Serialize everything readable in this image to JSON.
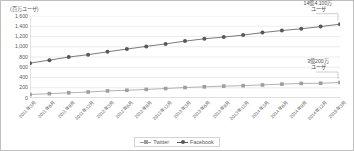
{
  "chart_data": {
    "type": "line",
    "title": "",
    "ylabel": "(百万ユーザ)",
    "xlabel": "",
    "ylim": [
      0,
      1600
    ],
    "ytick_step": 200,
    "grid": true,
    "legend_position": "bottom",
    "ytick_labels": [
      "0",
      "200",
      "400",
      "600",
      "800",
      "1,000",
      "1,200",
      "1,400",
      "1,600"
    ],
    "ytick_values": [
      0,
      200,
      400,
      600,
      800,
      1000,
      1200,
      1400,
      1600
    ],
    "categories": [
      "2011年3月",
      "2011年6月",
      "2011年9月",
      "2011年12月",
      "2012年3月",
      "2012年6月",
      "2012年9月",
      "2012年12月",
      "2013年3月",
      "2013年6月",
      "2013年9月",
      "2013年12月",
      "2014年3月",
      "2014年6月",
      "2014年9月",
      "2014年12月",
      "2015年3月"
    ],
    "series": [
      {
        "name": "Twitter",
        "color": "#9e9e9e",
        "marker": "square",
        "values": [
          68,
          85,
          101,
          117,
          138,
          151,
          167,
          185,
          204,
          218,
          232,
          241,
          255,
          271,
          284,
          288,
          302
        ]
      },
      {
        "name": "Facebook",
        "color": "#595959",
        "marker": "circle",
        "values": [
          680,
          739,
          800,
          845,
          901,
          955,
          1007,
          1056,
          1110,
          1155,
          1189,
          1228,
          1276,
          1317,
          1350,
          1393,
          1441
        ]
      }
    ],
    "annotations": [
      {
        "id": "facebook-callout",
        "text_line1": "14億4,100万",
        "text_line2": "ユーザ",
        "target_series": "Facebook",
        "target_point": "2015年3月",
        "target_value": 1441
      },
      {
        "id": "twitter-callout",
        "text_line1": "3億200万",
        "text_line2": "ユーザ",
        "target_series": "Twitter",
        "target_point": "2015年3月",
        "target_value": 302
      }
    ]
  },
  "colors": {
    "axis": "#a6a6a6",
    "grid": "#d9d9d9",
    "text": "#595959",
    "border": "#bfbfbf",
    "twitter": "#9e9e9e",
    "facebook": "#595959"
  }
}
